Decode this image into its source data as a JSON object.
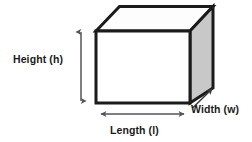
{
  "diagram": {
    "shape_name": "rectangular-prism",
    "background_color": "#ffffff",
    "stroke_color": "#1b1b1b",
    "front_face_fill": "#ffffff",
    "top_face_fill": "#fdfdfd",
    "side_face_fill": "#c8c8c8",
    "labels": {
      "height": "Height (h)",
      "length": "Length (l)",
      "width": "Width (w)"
    },
    "dimension_arrows": [
      {
        "name": "height-arrow",
        "orientation": "vertical",
        "heads": "double",
        "measures": "Height (h)"
      },
      {
        "name": "length-arrow",
        "orientation": "horizontal",
        "heads": "double",
        "measures": "Length (l)"
      },
      {
        "name": "width-arrow",
        "orientation": "diagonal",
        "heads": "single",
        "measures": "Width (w)"
      }
    ]
  }
}
